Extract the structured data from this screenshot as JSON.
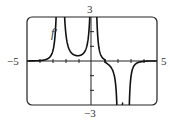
{
  "chart_data": {
    "type": "line",
    "title": "",
    "function_label": "f'",
    "xlabel": "",
    "ylabel": "",
    "xlim": [
      -5,
      5
    ],
    "ylim": [
      -3,
      3
    ],
    "x_tick_labels": [
      "-5",
      "5"
    ],
    "y_tick_labels": [
      "3",
      "-3"
    ],
    "grid": false,
    "series": [
      {
        "name": "f'",
        "description": "Derivative graph: near 0 for x<-3, vertical asymptote near x≈-2.5 (goes to +inf), local min ~0.6 near x≈-1.2, vertical asymptote near x≈0 (+inf both sides), decreases to 0 then to -inf near x≈2, returns from -inf near x≈2.8, approaches 0 for x>4",
        "asymptotes_x": [
          -2.5,
          0.1,
          2.1,
          2.8
        ],
        "points": [
          [
            -5,
            0.0
          ],
          [
            -4,
            0.02
          ],
          [
            -3.5,
            0.1
          ],
          [
            -3,
            0.4
          ],
          [
            -2.7,
            1.5
          ],
          [
            -2.55,
            3.0
          ],
          [
            -2.25,
            3.0
          ],
          [
            -2.0,
            1.2
          ],
          [
            -1.5,
            0.7
          ],
          [
            -1.2,
            0.6
          ],
          [
            -0.8,
            0.8
          ],
          [
            -0.4,
            1.6
          ],
          [
            -0.15,
            3.0
          ],
          [
            0.3,
            3.0
          ],
          [
            0.6,
            1.0
          ],
          [
            1.0,
            0.15
          ],
          [
            1.3,
            -0.3
          ],
          [
            1.7,
            -1.2
          ],
          [
            1.95,
            -3.0
          ],
          [
            2.85,
            -3.0
          ],
          [
            3.1,
            -1.0
          ],
          [
            3.5,
            -0.3
          ],
          [
            4.0,
            -0.05
          ],
          [
            5,
            0.0
          ]
        ]
      }
    ]
  },
  "labels": {
    "y_top": "3",
    "y_bottom": "−3",
    "x_left": "−5",
    "x_right": "5",
    "curve": "f′"
  }
}
